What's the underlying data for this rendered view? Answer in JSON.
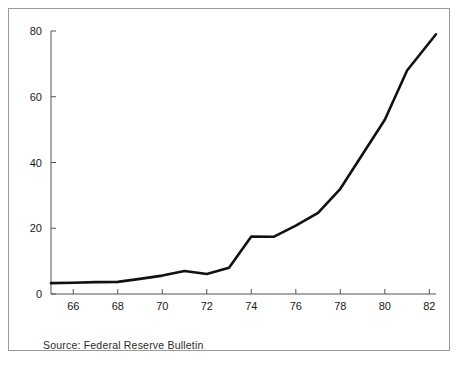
{
  "figure": {
    "source_note": "Source:  Federal Reserve Bulletin",
    "frame_color": "#9a9a9a",
    "line_color": "#111111",
    "axis_color": "#555555",
    "background": "#ffffff"
  },
  "chart_data": {
    "type": "line",
    "title": "",
    "subtitle": "",
    "xlabel": "",
    "ylabel": "",
    "xlim": [
      65,
      82.3
    ],
    "ylim": [
      0,
      80
    ],
    "grid": false,
    "legend": null,
    "legend_position": "none",
    "x_tick_labels": [
      "66",
      "68",
      "70",
      "72",
      "74",
      "76",
      "78",
      "80",
      "82"
    ],
    "x_ticks": [
      66,
      68,
      70,
      72,
      74,
      76,
      78,
      80,
      82
    ],
    "y_tick_labels": [
      "0",
      "20",
      "40",
      "60",
      "80"
    ],
    "y_ticks": [
      0,
      20,
      40,
      60,
      80
    ],
    "series": [
      {
        "name": "value",
        "x": [
          65,
          66,
          67,
          68,
          69,
          70,
          71,
          72,
          73,
          74,
          75,
          76,
          77,
          78,
          79,
          80,
          81,
          82.3
        ],
        "values": [
          3.3,
          3.4,
          3.6,
          3.7,
          4.6,
          5.6,
          7.0,
          6.1,
          8.0,
          17.5,
          17.4,
          20.8,
          24.7,
          32.0,
          42.5,
          53.0,
          68.0,
          79.0
        ]
      }
    ],
    "annotations": [
      {
        "text": "Source:  Federal Reserve Bulletin",
        "position": "below-axis-left"
      }
    ]
  }
}
